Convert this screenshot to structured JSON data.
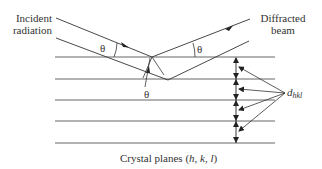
{
  "diagram": {
    "type": "bragg-diffraction",
    "labels": {
      "incident_line1": "Incident",
      "incident_line2": "radiation",
      "diffracted_line1": "Diffracted",
      "diffracted_line2": "beam",
      "theta": "θ",
      "d_main": "d",
      "d_sub": "hkl",
      "planes_prefix": "Crystal planes (",
      "planes_h": "h",
      "planes_sep1": ", ",
      "planes_k": "k",
      "planes_sep2": ", ",
      "planes_l": "l",
      "planes_suffix": ")"
    },
    "colors": {
      "line": "#444444",
      "text": "#333333",
      "background": "#ffffff"
    },
    "planes_y": [
      57,
      79,
      100,
      121,
      143
    ],
    "plane_x_range": [
      55,
      275
    ]
  }
}
